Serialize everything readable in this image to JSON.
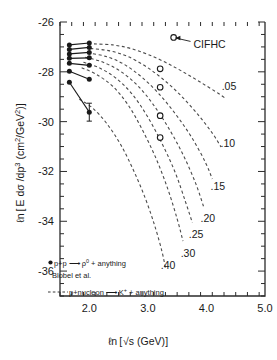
{
  "chart_data": {
    "type": "scatter",
    "title": "",
    "xlabel": "ℓn [√s (GeV)]",
    "ylabel": "ℓn [E dσ /dp³ (cm²/GeV²)]",
    "xlim": [
      1.5,
      5.0
    ],
    "ylim": [
      -37.0,
      -26.0
    ],
    "xticks": [
      2.0,
      3.0,
      4.0,
      5.0
    ],
    "xtick_labels": [
      "2.0",
      "3.0",
      "4.0",
      "5.0"
    ],
    "yticks": [
      -26,
      -28,
      -30,
      -32,
      -34,
      -36
    ],
    "ytick_labels": [
      "-26",
      "-28",
      "-30",
      "-32",
      "-34",
      "-36"
    ],
    "x_minor_per_major": 5,
    "y_minor_per_major": 4,
    "grid": false,
    "legend_position": "lower-left",
    "series": [
      {
        "name": "p+p → ρ⁰ + anything (Blobel et al.)",
        "marker": "filled-circle",
        "line": "solid",
        "points": [
          {
            "x": 1.66,
            "y": -26.92
          },
          {
            "x": 2.0,
            "y": -26.84
          },
          {
            "x": 1.66,
            "y": -27.1
          },
          {
            "x": 2.0,
            "y": -27.02
          },
          {
            "x": 1.66,
            "y": -27.28
          },
          {
            "x": 2.0,
            "y": -27.22
          },
          {
            "x": 1.66,
            "y": -27.46
          },
          {
            "x": 2.0,
            "y": -27.44
          },
          {
            "x": 1.66,
            "y": -27.66
          },
          {
            "x": 2.0,
            "y": -27.74
          },
          {
            "x": 1.66,
            "y": -27.98
          },
          {
            "x": 2.0,
            "y": -28.3
          },
          {
            "x": 1.66,
            "y": -28.42
          },
          {
            "x": 2.0,
            "y": -29.62
          }
        ],
        "segments": [
          [
            [
              1.66,
              -26.92
            ],
            [
              2.0,
              -26.84
            ]
          ],
          [
            [
              1.66,
              -27.1
            ],
            [
              2.0,
              -27.02
            ]
          ],
          [
            [
              1.66,
              -27.28
            ],
            [
              2.0,
              -27.22
            ]
          ],
          [
            [
              1.66,
              -27.46
            ],
            [
              2.0,
              -27.44
            ]
          ],
          [
            [
              1.66,
              -27.66
            ],
            [
              2.0,
              -27.74
            ]
          ],
          [
            [
              1.66,
              -27.98
            ],
            [
              2.0,
              -28.3
            ]
          ],
          [
            [
              1.66,
              -28.42
            ],
            [
              2.0,
              -29.62
            ]
          ]
        ],
        "error_bars": [
          {
            "x": 2.0,
            "y": -29.62,
            "minus": 0.36,
            "plus": 0.36
          }
        ]
      },
      {
        "name": "CIFHC",
        "marker": "open-circle",
        "line": "none",
        "points": [
          {
            "x": 3.44,
            "y": -26.62
          },
          {
            "x": 3.21,
            "y": -27.88
          },
          {
            "x": 3.21,
            "y": -28.62
          },
          {
            "x": 3.21,
            "y": -29.76
          },
          {
            "x": 3.21,
            "y": -30.64
          }
        ]
      }
    ],
    "model_curves": {
      "name": "p+nucleon → K⁺ + anything",
      "line": "dashed",
      "curves": [
        {
          "label": ".05",
          "label_x": 4.26,
          "label_y": -28.72,
          "path": [
            [
              2.08,
              -26.88
            ],
            [
              2.4,
              -26.92
            ],
            [
              2.7,
              -27.06
            ],
            [
              3.0,
              -27.3
            ],
            [
              3.3,
              -27.62
            ],
            [
              3.6,
              -28.0
            ],
            [
              3.9,
              -28.42
            ],
            [
              4.2,
              -28.86
            ],
            [
              4.32,
              -29.06
            ]
          ]
        },
        {
          "label": ".10",
          "label_x": 4.24,
          "label_y": -31.02,
          "path": [
            [
              2.02,
              -27.06
            ],
            [
              2.35,
              -27.16
            ],
            [
              2.65,
              -27.38
            ],
            [
              2.95,
              -27.76
            ],
            [
              3.25,
              -28.28
            ],
            [
              3.55,
              -28.92
            ],
            [
              3.85,
              -29.7
            ],
            [
              4.1,
              -30.46
            ],
            [
              4.25,
              -31.02
            ]
          ]
        },
        {
          "label": ".15",
          "label_x": 4.07,
          "label_y": -32.74,
          "path": [
            [
              1.97,
              -27.24
            ],
            [
              2.28,
              -27.38
            ],
            [
              2.58,
              -27.68
            ],
            [
              2.88,
              -28.18
            ],
            [
              3.18,
              -28.86
            ],
            [
              3.48,
              -29.72
            ],
            [
              3.75,
              -30.64
            ],
            [
              3.98,
              -31.62
            ],
            [
              4.1,
              -32.3
            ]
          ]
        },
        {
          "label": ".20",
          "label_x": 3.9,
          "label_y": -34.02,
          "path": [
            [
              1.93,
              -27.42
            ],
            [
              2.22,
              -27.6
            ],
            [
              2.52,
              -27.96
            ],
            [
              2.82,
              -28.54
            ],
            [
              3.1,
              -29.34
            ],
            [
              3.38,
              -30.36
            ],
            [
              3.62,
              -31.42
            ],
            [
              3.82,
              -32.5
            ],
            [
              3.95,
              -33.4
            ]
          ]
        },
        {
          "label": ".25",
          "label_x": 3.7,
          "label_y": -34.68,
          "path": [
            [
              1.9,
              -27.62
            ],
            [
              2.17,
              -27.84
            ],
            [
              2.46,
              -28.26
            ],
            [
              2.74,
              -28.92
            ],
            [
              3.0,
              -29.82
            ],
            [
              3.25,
              -30.92
            ],
            [
              3.47,
              -32.06
            ],
            [
              3.64,
              -33.2
            ],
            [
              3.76,
              -34.06
            ]
          ]
        },
        {
          "label": ".30",
          "label_x": 3.56,
          "label_y": -35.42,
          "path": [
            [
              1.87,
              -27.84
            ],
            [
              2.12,
              -28.1
            ],
            [
              2.4,
              -28.58
            ],
            [
              2.66,
              -29.32
            ],
            [
              2.9,
              -30.3
            ],
            [
              3.14,
              -31.48
            ],
            [
              3.34,
              -32.7
            ],
            [
              3.5,
              -33.9
            ],
            [
              3.6,
              -34.8
            ]
          ]
        },
        {
          "label": ".40",
          "label_x": 3.22,
          "label_y": -35.92,
          "path": [
            [
              1.83,
              -29.1
            ],
            [
              2.06,
              -29.46
            ],
            [
              2.3,
              -30.08
            ],
            [
              2.54,
              -30.94
            ],
            [
              2.76,
              -31.98
            ],
            [
              2.96,
              -33.1
            ],
            [
              3.12,
              -34.2
            ],
            [
              3.24,
              -35.2
            ],
            [
              3.3,
              -35.88
            ]
          ]
        }
      ]
    },
    "annotations": [
      {
        "text": "CIFHC",
        "x": 3.78,
        "y": -26.9,
        "points_to": [
          3.47,
          -26.64
        ]
      }
    ],
    "legend": [
      {
        "marker": "filled-circle",
        "text": "p+p → ρ⁰ + anything"
      },
      {
        "marker": "none",
        "text": "Blobel et al."
      },
      {
        "marker": "dashed-line",
        "text": "p+nucleon → K⁺ + anything"
      }
    ]
  },
  "labels": {
    "xaxis_parts": {
      "ln": "ℓn",
      "bracket_open": "[",
      "sqrt": "√",
      "s": "s",
      "unit": "(GeV)",
      "bracket_close": "]"
    },
    "yaxis_parts": {
      "ln": "ℓn",
      "bracket_open": "[",
      "expr": "E dσ /dp",
      "exp": "3",
      "unit_open": "(cm",
      "unit_exp1": "2",
      "unit_div": "/GeV",
      "unit_exp2": "2",
      "unit_close": ")",
      "bracket_close": "]"
    },
    "legend_line1_marker": "●",
    "legend_line1_a": "p+p",
    "legend_line1_arrow": "⟶",
    "legend_line1_b": "ρ",
    "legend_line1_sup": "0",
    "legend_line1_c": "+ anything",
    "legend_line2": "Blobel et al.",
    "legend_line3_a": "p+nucleon",
    "legend_line3_arrow": "⟶",
    "legend_line3_b": "K",
    "legend_line3_sup": "+",
    "legend_line3_c": "+ anything",
    "annotation_cifhc": "CIFHC"
  },
  "colors": {
    "ink": "#1a1a1a",
    "axis": "#2b2b2b",
    "dash": "#4a4a4a",
    "background": "#ffffff"
  }
}
